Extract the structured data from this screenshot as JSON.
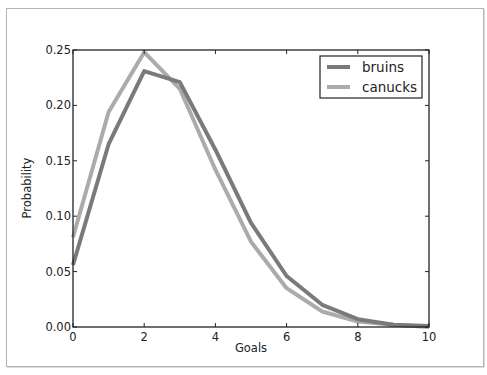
{
  "chart_data": {
    "type": "line",
    "title": "",
    "xlabel": "Goals",
    "ylabel": "Probability",
    "xlim": [
      0,
      10
    ],
    "ylim": [
      0,
      0.25
    ],
    "grid": false,
    "legend_position": "upper right",
    "x": [
      0,
      1,
      2,
      3,
      4,
      5,
      6,
      7,
      8,
      9,
      10
    ],
    "xticks": [
      "0",
      "2",
      "4",
      "6",
      "8",
      "10"
    ],
    "yticks": [
      "0.00",
      "0.05",
      "0.10",
      "0.15",
      "0.20",
      "0.25"
    ],
    "series": [
      {
        "name": "bruins",
        "color": "#7a7a7a",
        "values": [
          0.056,
          0.165,
          0.231,
          0.221,
          0.16,
          0.094,
          0.046,
          0.02,
          0.007,
          0.002,
          0.001
        ]
      },
      {
        "name": "canucks",
        "color": "#ababab",
        "values": [
          0.081,
          0.194,
          0.248,
          0.215,
          0.142,
          0.077,
          0.035,
          0.014,
          0.005,
          0.002,
          0.0
        ]
      }
    ]
  }
}
